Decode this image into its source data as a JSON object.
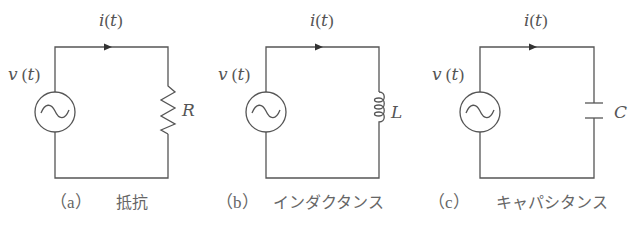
{
  "figure": {
    "circuits": [
      {
        "id": "a",
        "current_label": "i(t)",
        "current_var": "i",
        "current_arg": "t",
        "voltage_var": "v",
        "voltage_arg": "t",
        "source_symbol": "ac-source",
        "element": "resistor",
        "element_label": "R",
        "caption_tag": "（a）",
        "caption_text": "抵抗"
      },
      {
        "id": "b",
        "current_var": "i",
        "current_arg": "t",
        "voltage_var": "v",
        "voltage_arg": "t",
        "source_symbol": "ac-source",
        "element": "inductor",
        "element_label": "L",
        "caption_tag": "（b）",
        "caption_text": "インダクタンス"
      },
      {
        "id": "c",
        "current_var": "i",
        "current_arg": "t",
        "voltage_var": "v",
        "voltage_arg": "t",
        "source_symbol": "ac-source",
        "element": "capacitor",
        "element_label": "C",
        "caption_tag": "（c）",
        "caption_text": "キャパシタンス"
      }
    ],
    "colors": {
      "line": "#555555",
      "text": "#555555",
      "background": "#ffffff"
    }
  }
}
